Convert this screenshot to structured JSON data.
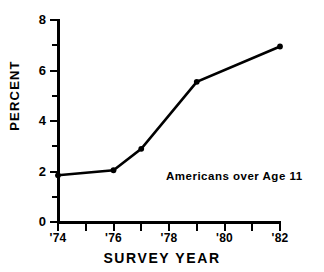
{
  "chart_data": {
    "type": "line",
    "title": "",
    "subtitle": "",
    "xlabel": "SURVEY YEAR",
    "ylabel": "PERCENT",
    "xlim": [
      1973.5,
      1982.5
    ],
    "ylim": [
      0,
      8
    ],
    "grid": false,
    "legend_position": "none",
    "annotations": [
      {
        "text": "Americans over Age 11",
        "x": 1979.0,
        "y": 1.75
      }
    ],
    "x_tick_labels": [
      "'74",
      "'76",
      "'78",
      "'80",
      "'82"
    ],
    "x_tick_values": [
      1974,
      1976,
      1978,
      1980,
      1982
    ],
    "x_minor_ticks": [
      1975,
      1977,
      1979,
      1981
    ],
    "y_tick_labels": [
      "0",
      "2",
      "4",
      "6",
      "8"
    ],
    "y_tick_values": [
      0,
      2,
      4,
      6,
      8
    ],
    "y_minor_ticks": [
      1,
      3,
      5,
      7
    ],
    "series": [
      {
        "name": "Americans over Age 11",
        "color": "#000000",
        "marker": "circle",
        "x": [
          1974,
          1976,
          1977,
          1979,
          1982
        ],
        "values": [
          1.85,
          2.05,
          2.9,
          5.55,
          6.95
        ]
      }
    ]
  },
  "axis": {
    "y_title": "PERCENT",
    "x_title": "SURVEY YEAR"
  },
  "annotation": {
    "series_label": "Americans over Age 11"
  },
  "ticks": {
    "y": [
      "0",
      "2",
      "4",
      "6",
      "8"
    ],
    "x": [
      "'74",
      "'76",
      "'78",
      "'80",
      "'82"
    ]
  }
}
